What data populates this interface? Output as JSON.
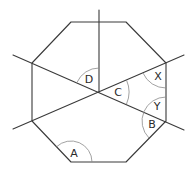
{
  "diagram": {
    "labels": {
      "A": "A",
      "B": "B",
      "C": "C",
      "D": "D",
      "X": "X",
      "Y": "Y"
    },
    "colors": {
      "line": "#3a3a3a",
      "arc": "#8a8a8a",
      "text": "#2a2a2a",
      "background": "#ffffff"
    }
  }
}
